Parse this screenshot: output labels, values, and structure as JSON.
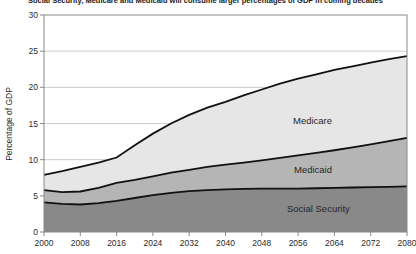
{
  "title": "Social Security, Medicare and Medicaid will consume larger percentages of GDP in coming decades",
  "ylabel": "Percentage of GDP",
  "colors": {
    "social_security_fill": "#898989",
    "medicaid_fill": "#b5b5b5",
    "medicare_fill": "#e6e6e6",
    "boundary_line": "#111111",
    "plot_frame": "#8a8a8a",
    "gridline": "#cccccc",
    "text": "#2b2b2b",
    "background": "#ffffff"
  },
  "labels": {
    "medicare": "Medicare",
    "medicaid": "Medicaid",
    "social_security": "Social Security"
  },
  "chart_data": {
    "type": "area",
    "stacked": true,
    "title": "Social Security, Medicare and Medicaid will consume larger percentages of GDP in coming decades",
    "xlabel": "",
    "ylabel": "Percentage of GDP",
    "units": "% of GDP",
    "xlim": [
      2000,
      2080
    ],
    "ylim": [
      0,
      30
    ],
    "x_ticks": [
      2000,
      2008,
      2016,
      2024,
      2032,
      2040,
      2048,
      2056,
      2064,
      2072,
      2080
    ],
    "y_ticks": [
      0,
      5,
      10,
      15,
      20,
      25,
      30
    ],
    "grid": "horizontal",
    "legend": "inline-area-labels",
    "x": [
      2000,
      2004,
      2008,
      2012,
      2016,
      2020,
      2024,
      2028,
      2032,
      2036,
      2040,
      2044,
      2048,
      2052,
      2056,
      2060,
      2064,
      2068,
      2072,
      2076,
      2080
    ],
    "series": [
      {
        "name": "Social Security",
        "values": [
          4.1,
          3.9,
          3.8,
          4.0,
          4.3,
          4.7,
          5.1,
          5.4,
          5.65,
          5.8,
          5.9,
          5.95,
          6.0,
          6.0,
          6.0,
          6.05,
          6.1,
          6.15,
          6.2,
          6.25,
          6.3
        ],
        "cumulative_top": [
          4.1,
          3.9,
          3.8,
          4.0,
          4.3,
          4.7,
          5.1,
          5.4,
          5.65,
          5.8,
          5.9,
          5.95,
          6.0,
          6.0,
          6.0,
          6.05,
          6.1,
          6.15,
          6.2,
          6.25,
          6.3
        ],
        "color": "#898989"
      },
      {
        "name": "Medicaid",
        "values": [
          1.7,
          1.6,
          1.8,
          2.1,
          2.5,
          2.5,
          2.6,
          2.8,
          2.95,
          3.2,
          3.4,
          3.65,
          3.9,
          4.25,
          4.6,
          4.9,
          5.2,
          5.55,
          5.9,
          6.3,
          6.7
        ],
        "cumulative_top": [
          5.8,
          5.5,
          5.6,
          6.1,
          6.8,
          7.2,
          7.7,
          8.2,
          8.6,
          9.0,
          9.3,
          9.6,
          9.9,
          10.25,
          10.6,
          10.95,
          11.3,
          11.7,
          12.1,
          12.55,
          13.0
        ],
        "color": "#b5b5b5"
      },
      {
        "name": "Medicare",
        "values": [
          2.1,
          2.9,
          3.4,
          3.5,
          3.5,
          4.8,
          5.9,
          6.8,
          7.6,
          8.2,
          8.7,
          9.3,
          9.8,
          10.25,
          10.6,
          10.85,
          11.1,
          11.2,
          11.3,
          11.35,
          11.3
        ],
        "cumulative_top": [
          7.9,
          8.4,
          9.0,
          9.6,
          10.3,
          12.0,
          13.6,
          15.0,
          16.2,
          17.2,
          18.0,
          18.9,
          19.7,
          20.5,
          21.2,
          21.8,
          22.4,
          22.9,
          23.4,
          23.9,
          24.3
        ],
        "color": "#e6e6e6"
      }
    ]
  },
  "plot": {
    "left": 44,
    "right": 407,
    "top": 15,
    "bottom": 232
  }
}
